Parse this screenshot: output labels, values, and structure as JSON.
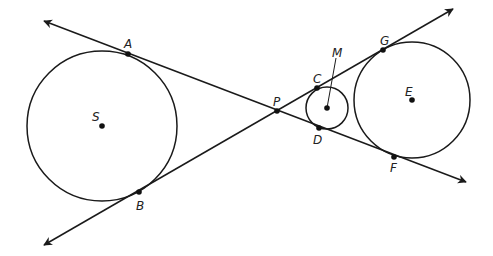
{
  "diagram": {
    "type": "geometry-tangent-circles",
    "colors": {
      "stroke": "#1a1a1a",
      "point": "#111111",
      "label": "#222222",
      "background": "#ffffff"
    },
    "lines": [
      {
        "name": "line-APDF",
        "from": [
          44,
          21
        ],
        "to": [
          466,
          182
        ],
        "arrows": "both",
        "points_on_line": [
          "A",
          "P",
          "D",
          "F"
        ]
      },
      {
        "name": "line-BPCG",
        "from": [
          44,
          245
        ],
        "to": [
          453,
          9
        ],
        "arrows": "both",
        "points_on_line": [
          "B",
          "P",
          "C",
          "G"
        ]
      }
    ],
    "circles": [
      {
        "name": "circle-S",
        "center_label": "S",
        "cx": 102,
        "cy": 126,
        "r": 75
      },
      {
        "name": "circle-M",
        "center_label": "M",
        "cx": 327,
        "cy": 108,
        "r": 21
      },
      {
        "name": "circle-E",
        "center_label": "E",
        "cx": 412,
        "cy": 100,
        "r": 58
      }
    ],
    "points": {
      "A": {
        "label": "A",
        "x": 128,
        "y": 54
      },
      "B": {
        "label": "B",
        "x": 139,
        "y": 192
      },
      "S": {
        "label": "S",
        "x": 102,
        "y": 126
      },
      "P": {
        "label": "P",
        "x": 277,
        "y": 111
      },
      "C": {
        "label": "C",
        "x": 317,
        "y": 88
      },
      "D": {
        "label": "D",
        "x": 319,
        "y": 128
      },
      "M": {
        "label": "M",
        "x": 327,
        "y": 108
      },
      "G": {
        "label": "G",
        "x": 383,
        "y": 50
      },
      "E": {
        "label": "E",
        "x": 412,
        "y": 100
      },
      "F": {
        "label": "F",
        "x": 394,
        "y": 157
      }
    },
    "leader": {
      "name": "M-leader",
      "from": [
        336,
        58
      ],
      "to": [
        327,
        108
      ]
    }
  }
}
